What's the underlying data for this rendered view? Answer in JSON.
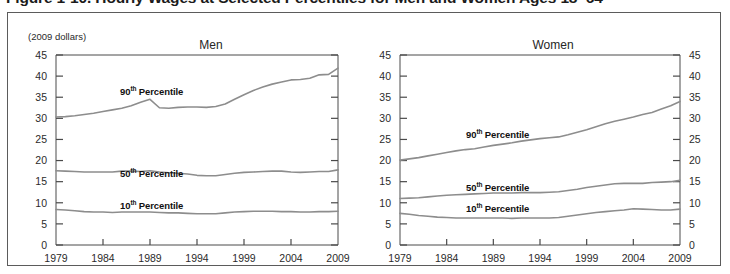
{
  "figure": {
    "title": "Figure 1-10.  Hourly Wages at Selected Percentiles for Men and Women Ages 18–64",
    "units_label": "(2009 dollars)"
  },
  "panels": {
    "men": {
      "title": "Men"
    },
    "women": {
      "title": "Women"
    }
  },
  "series_labels": {
    "p90_prefix": "90",
    "p90_sup": "th",
    "p90_suffix": " Percentile",
    "p50_prefix": "50",
    "p50_sup": "th",
    "p50_suffix": " Percentile",
    "p10_prefix": "10",
    "p10_sup": "th",
    "p10_suffix": " Percentile"
  },
  "axis": {
    "y_ticks": [
      "45",
      "40",
      "35",
      "30",
      "25",
      "20",
      "15",
      "10",
      "5",
      "0"
    ],
    "x_ticks": [
      "1979",
      "1984",
      "1989",
      "1994",
      "1999",
      "2004",
      "2009"
    ]
  },
  "colors": {
    "line": "#8d8d8d",
    "axis": "#4a4a4a",
    "border": "#5b5b5b",
    "text": "#1a1a1a",
    "background": "#ffffff"
  },
  "chart_data": {
    "type": "line",
    "title": "Figure 1-10.  Hourly Wages at Selected Percentiles for Men and Women Ages 18–64",
    "subtitle": "(2009 dollars)",
    "xlabel": "",
    "ylabel": "(2009 dollars)",
    "xlim": [
      1979,
      2009
    ],
    "ylim": [
      0,
      45
    ],
    "y_ticks": [
      0,
      5,
      10,
      15,
      20,
      25,
      30,
      35,
      40,
      45
    ],
    "x_ticks": [
      1979,
      1984,
      1989,
      1994,
      1999,
      2004,
      2009
    ],
    "grid": false,
    "legend": "inline-annotations",
    "x": [
      1979,
      1980,
      1981,
      1982,
      1983,
      1984,
      1985,
      1986,
      1987,
      1988,
      1989,
      1990,
      1991,
      1992,
      1993,
      1994,
      1995,
      1996,
      1997,
      1998,
      1999,
      2000,
      2001,
      2002,
      2003,
      2004,
      2005,
      2006,
      2007,
      2008,
      2009
    ],
    "panels": [
      {
        "name": "Men",
        "series": [
          {
            "name": "90th Percentile",
            "values": [
              30.3,
              30.4,
              30.6,
              30.9,
              31.2,
              31.6,
              32.0,
              32.4,
              33.0,
              33.8,
              34.5,
              32.5,
              32.4,
              32.6,
              32.7,
              32.7,
              32.6,
              32.8,
              33.4,
              34.5,
              35.6,
              36.6,
              37.4,
              38.1,
              38.6,
              39.1,
              39.2,
              39.5,
              40.3,
              40.4,
              41.9
            ]
          },
          {
            "name": "50th Percentile",
            "values": [
              17.6,
              17.5,
              17.4,
              17.3,
              17.3,
              17.3,
              17.3,
              17.5,
              17.5,
              17.4,
              17.6,
              17.3,
              17.1,
              17.0,
              16.8,
              16.5,
              16.4,
              16.4,
              16.7,
              17.0,
              17.2,
              17.3,
              17.4,
              17.5,
              17.5,
              17.3,
              17.2,
              17.3,
              17.4,
              17.4,
              17.8
            ]
          },
          {
            "name": "10th Percentile",
            "values": [
              8.4,
              8.3,
              8.1,
              7.9,
              7.8,
              7.8,
              7.7,
              7.8,
              7.8,
              7.8,
              7.8,
              7.7,
              7.6,
              7.6,
              7.5,
              7.4,
              7.4,
              7.4,
              7.6,
              7.8,
              7.9,
              8.0,
              8.0,
              8.0,
              7.9,
              7.9,
              7.8,
              7.8,
              7.9,
              7.9,
              8.0
            ]
          }
        ]
      },
      {
        "name": "Women",
        "series": [
          {
            "name": "90th Percentile",
            "values": [
              20.1,
              20.4,
              20.7,
              21.1,
              21.5,
              21.9,
              22.3,
              22.6,
              22.8,
              23.2,
              23.6,
              23.9,
              24.2,
              24.6,
              24.9,
              25.2,
              25.4,
              25.6,
              26.1,
              26.7,
              27.3,
              28.0,
              28.7,
              29.3,
              29.8,
              30.3,
              30.9,
              31.4,
              32.2,
              33.0,
              34.0
            ]
          },
          {
            "name": "50th Percentile",
            "values": [
              11.0,
              11.1,
              11.2,
              11.4,
              11.6,
              11.8,
              11.9,
              12.0,
              12.1,
              12.2,
              12.3,
              12.3,
              12.3,
              12.4,
              12.4,
              12.4,
              12.5,
              12.6,
              12.9,
              13.2,
              13.6,
              13.9,
              14.2,
              14.5,
              14.6,
              14.6,
              14.6,
              14.8,
              14.9,
              15.0,
              15.3
            ]
          },
          {
            "name": "10th Percentile",
            "values": [
              7.5,
              7.3,
              7.0,
              6.8,
              6.6,
              6.5,
              6.4,
              6.4,
              6.4,
              6.4,
              6.4,
              6.4,
              6.3,
              6.4,
              6.4,
              6.4,
              6.4,
              6.5,
              6.8,
              7.1,
              7.4,
              7.7,
              7.9,
              8.1,
              8.3,
              8.6,
              8.5,
              8.4,
              8.3,
              8.3,
              8.5
            ]
          }
        ]
      }
    ]
  }
}
